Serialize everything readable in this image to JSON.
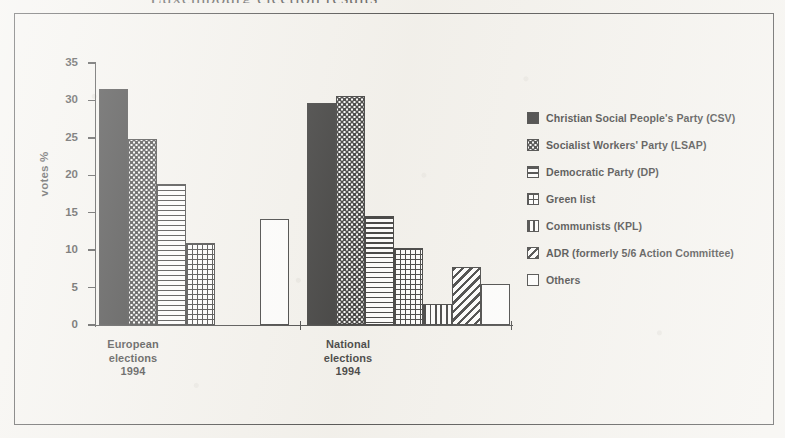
{
  "figure": {
    "cut_caption_above_frame": "Luxembourg election results",
    "frame_border_color": "#2a2a2a",
    "ink_color": "#151515",
    "paper_color": "#f3f1ec"
  },
  "axes": {
    "y_title": "votes %",
    "y_ticks": [
      "35",
      "30",
      "25",
      "20",
      "15",
      "10",
      "5",
      "0"
    ],
    "y_min": 0,
    "y_max": 35,
    "y_step": 5
  },
  "legend": {
    "entries": [
      {
        "label": "Christian Social People's Party (CSV)",
        "pattern": "solid",
        "swatch_name": "swatch-solid-black"
      },
      {
        "label": "Socialist Workers' Party (LSAP)",
        "pattern": "dots",
        "swatch_name": "swatch-dotted"
      },
      {
        "label": "Democratic Party (DP)",
        "pattern": "hlines",
        "swatch_name": "swatch-horizontal-lines"
      },
      {
        "label": "Green list",
        "pattern": "grid",
        "swatch_name": "swatch-grid"
      },
      {
        "label": "Communists (KPL)",
        "pattern": "vlines",
        "swatch_name": "swatch-vertical-lines"
      },
      {
        "label": "ADR (formerly 5/6 Action Committee)",
        "pattern": "diag",
        "swatch_name": "swatch-diagonal-hatch"
      },
      {
        "label": "Others",
        "pattern": "empty",
        "swatch_name": "swatch-empty-white"
      }
    ]
  },
  "chart_data": {
    "type": "bar",
    "title": "",
    "xlabel": "",
    "ylabel": "votes %",
    "ylim": [
      0,
      35
    ],
    "ytick_step": 5,
    "grid": false,
    "legend_position": "right",
    "categories": [
      "European\nelections\n1994",
      "National\nelections\n1994"
    ],
    "category_labels": [
      {
        "line1": "European",
        "line2": "elections",
        "line3": "1994"
      },
      {
        "line1": "National",
        "line2": "elections",
        "line3": "1994"
      }
    ],
    "series": [
      {
        "name": "Christian Social People's Party (CSV)",
        "pattern": "solid",
        "values": [
          31.5,
          29.7
        ]
      },
      {
        "name": "Socialist Workers' Party (LSAP)",
        "pattern": "dots",
        "values": [
          24.8,
          30.6
        ]
      },
      {
        "name": "Democratic Party (DP)",
        "pattern": "hlines",
        "values": [
          18.9,
          14.6
        ]
      },
      {
        "name": "Green list",
        "pattern": "grid",
        "values": [
          10.9,
          10.3
        ]
      },
      {
        "name": "Communists (KPL)",
        "pattern": "vlines",
        "values": [
          null,
          2.8
        ]
      },
      {
        "name": "ADR (formerly 5/6 Action Committee)",
        "pattern": "diag",
        "values": [
          null,
          7.8
        ]
      },
      {
        "name": "Others",
        "pattern": "empty",
        "values": [
          14.2,
          5.5
        ]
      }
    ],
    "bars": [
      {
        "group": 0,
        "series": "Christian Social People's Party (CSV)",
        "pattern": "solid",
        "value": 31.5,
        "x": 99,
        "width": 29
      },
      {
        "group": 0,
        "series": "Socialist Workers' Party (LSAP)",
        "pattern": "dots",
        "value": 24.8,
        "x": 128,
        "width": 29
      },
      {
        "group": 0,
        "series": "Democratic Party (DP)",
        "pattern": "hlines",
        "value": 18.9,
        "x": 157,
        "width": 29
      },
      {
        "group": 0,
        "series": "Green list",
        "pattern": "grid",
        "value": 10.9,
        "x": 186,
        "width": 29
      },
      {
        "group": 0,
        "series": "Others",
        "pattern": "empty",
        "value": 14.2,
        "x": 260,
        "width": 29
      },
      {
        "group": 1,
        "series": "Christian Social People's Party (CSV)",
        "pattern": "solid",
        "value": 29.7,
        "x": 307,
        "width": 29
      },
      {
        "group": 1,
        "series": "Socialist Workers' Party (LSAP)",
        "pattern": "dots",
        "value": 30.6,
        "x": 336,
        "width": 29
      },
      {
        "group": 1,
        "series": "Democratic Party (DP)",
        "pattern": "hlines",
        "value": 14.6,
        "x": 365,
        "width": 29
      },
      {
        "group": 1,
        "series": "Green list",
        "pattern": "grid",
        "value": 10.3,
        "x": 394,
        "width": 29
      },
      {
        "group": 1,
        "series": "Communists (KPL)",
        "pattern": "vlines",
        "value": 2.8,
        "x": 423,
        "width": 29
      },
      {
        "group": 1,
        "series": "ADR (formerly 5/6 Action Committee)",
        "pattern": "diag",
        "value": 7.8,
        "x": 452,
        "width": 29
      },
      {
        "group": 1,
        "series": "Others",
        "pattern": "empty",
        "value": 5.5,
        "x": 481,
        "width": 29
      }
    ]
  },
  "geometry": {
    "baseline_y": 325,
    "top_y": 63,
    "axis_x": 95,
    "px_per_unit": 7.4857,
    "base_ticks_x": [
      300,
      511
    ],
    "category_label_x": [
      133,
      348
    ]
  }
}
